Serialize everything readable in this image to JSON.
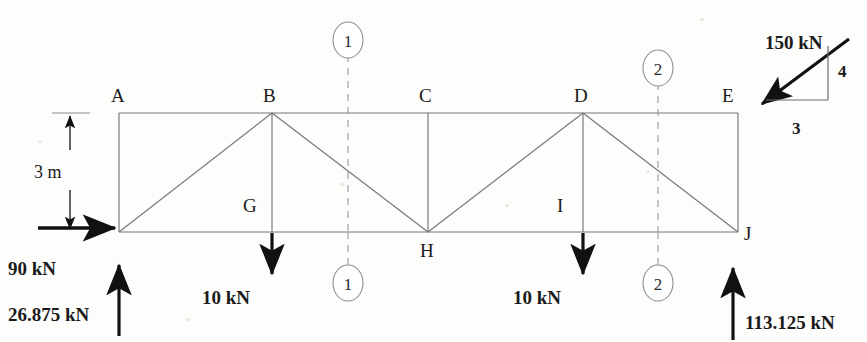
{
  "diagram": {
    "colors": {
      "ink": "#1a1a1a",
      "member": "#6b6b6b",
      "dash": "#8a8a8a",
      "paper": "#fdfdfc"
    },
    "nodes": [
      {
        "id": "A",
        "label": "A",
        "x": 119,
        "y": 113,
        "label_x": 111,
        "label_y": 86
      },
      {
        "id": "B",
        "label": "B",
        "x": 272,
        "y": 113,
        "label_x": 263,
        "label_y": 86
      },
      {
        "id": "C",
        "label": "C",
        "x": 428,
        "y": 113,
        "label_x": 419,
        "label_y": 86
      },
      {
        "id": "D",
        "label": "D",
        "x": 583,
        "y": 113,
        "label_x": 574,
        "label_y": 86
      },
      {
        "id": "E",
        "label": "E",
        "x": 738,
        "y": 113,
        "label_x": 722,
        "label_y": 86
      },
      {
        "id": "F",
        "label": "",
        "x": 119,
        "y": 232,
        "label_x": 0,
        "label_y": 0
      },
      {
        "id": "G",
        "label": "G",
        "x": 272,
        "y": 232,
        "label_x": 243,
        "label_y": 196
      },
      {
        "id": "H",
        "label": "H",
        "x": 428,
        "y": 232,
        "label_x": 420,
        "label_y": 241
      },
      {
        "id": "I",
        "label": "I",
        "x": 583,
        "y": 232,
        "label_x": 557,
        "label_y": 196
      },
      {
        "id": "J",
        "label": "J",
        "x": 738,
        "y": 232,
        "label_x": 744,
        "label_y": 224
      }
    ],
    "members": [
      {
        "name": "top-chord-A-E",
        "from": "A",
        "to": "E"
      },
      {
        "name": "bottom-chord-F-J",
        "from": "F",
        "to": "J"
      },
      {
        "name": "left-end-post-A-F",
        "from": "A",
        "to": "F"
      },
      {
        "name": "right-end-post-E-J",
        "from": "E",
        "to": "J"
      },
      {
        "name": "vertical-B-G",
        "from": "B",
        "to": "G"
      },
      {
        "name": "vertical-C-H",
        "from": "C",
        "to": "H"
      },
      {
        "name": "vertical-D-I",
        "from": "D",
        "to": "I"
      },
      {
        "name": "diagonal-F-B",
        "from": "F",
        "to": "B"
      },
      {
        "name": "diagonal-B-H",
        "from": "B",
        "to": "H"
      },
      {
        "name": "diagonal-H-D",
        "from": "H",
        "to": "D"
      },
      {
        "name": "diagonal-D-J",
        "from": "D",
        "to": "J"
      }
    ],
    "dimension": {
      "name": "height-dimension",
      "text": "3 m",
      "x": 70,
      "top_y": 113,
      "bottom_y": 232,
      "label_x": 34,
      "label_y": 163
    },
    "sections": [
      {
        "id": "1",
        "label": "1",
        "x": 348,
        "top_circle_y": 40,
        "bottom_circle_y": 283,
        "line_top_y": 55,
        "line_bottom_y": 268
      },
      {
        "id": "2",
        "label": "2",
        "x": 658,
        "top_circle_y": 68,
        "bottom_circle_y": 283,
        "line_top_y": 83,
        "line_bottom_y": 268
      }
    ],
    "loads": [
      {
        "name": "horizontal-load-90kn",
        "text": "90 kN",
        "value": 90,
        "unit": "kN",
        "direction": "right",
        "at_node": "F",
        "label_x": 8,
        "label_y": 259,
        "arrow_x1": 38,
        "arrow_x2": 117,
        "arrow_y": 228
      },
      {
        "name": "reaction-left-26875kn",
        "text": "26.875 kN",
        "value": 26.875,
        "unit": "kN",
        "direction": "up",
        "at_node": "F",
        "label_x": 8,
        "label_y": 305,
        "arrow_x": 119,
        "arrow_y1": 336,
        "arrow_y2": 265
      },
      {
        "name": "point-load-10kn-at-G",
        "text": "10 kN",
        "value": 10,
        "unit": "kN",
        "direction": "down",
        "at_node": "G",
        "label_x": 202,
        "label_y": 288,
        "arrow_x": 272,
        "arrow_y1": 233,
        "arrow_y2": 277
      },
      {
        "name": "point-load-10kn-at-I",
        "text": "10 kN",
        "value": 10,
        "unit": "kN",
        "direction": "down",
        "at_node": "I",
        "label_x": 513,
        "label_y": 288,
        "arrow_x": 583,
        "arrow_y1": 233,
        "arrow_y2": 277
      },
      {
        "name": "inclined-load-150kn-at-E",
        "text": "150 kN",
        "value": 150,
        "unit": "kN",
        "direction": "down-left",
        "at_node": "E",
        "label_x": 765,
        "label_y": 33,
        "arrow_x1": 846,
        "arrow_y1": 41,
        "arrow_x2": 757,
        "arrow_y2": 107
      },
      {
        "name": "reaction-right-113125kn",
        "text": "113.125 kN",
        "value": 113.125,
        "unit": "kN",
        "direction": "up",
        "at_node": "J",
        "label_x": 745,
        "label_y": 313,
        "arrow_x": 733,
        "arrow_y1": 340,
        "arrow_y2": 268
      }
    ],
    "slope_triangle": {
      "name": "slope-triangle-3-4",
      "vertical_label": "4",
      "horizontal_label": "3",
      "vertical_label_x": 838,
      "vertical_label_y": 63,
      "horizontal_label_x": 792,
      "horizontal_label_y": 120,
      "corner_x": 828,
      "top_y": 44,
      "bottom_y": 100,
      "left_x": 762
    }
  }
}
